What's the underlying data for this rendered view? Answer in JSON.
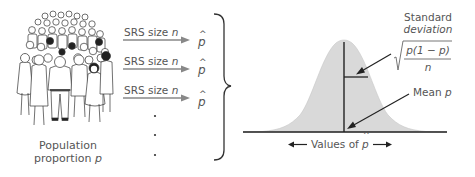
{
  "population": {
    "caption_line1": "Population",
    "caption_line2_prefix": "proportion ",
    "caption_line2_symbol": "p",
    "illustration": "crowd-of-people"
  },
  "samples": [
    {
      "label_prefix": "SRS size ",
      "label_symbol": "n",
      "result": "p",
      "result_accent": "^"
    },
    {
      "label_prefix": "SRS size ",
      "label_symbol": "n",
      "result": "p",
      "result_accent": "^"
    },
    {
      "label_prefix": "SRS size ",
      "label_symbol": "n",
      "result": "p",
      "result_accent": "^"
    }
  ],
  "continuation": ".",
  "distribution": {
    "shape": "normal-curve",
    "fill_color": "#d9d9d9",
    "line_color": "#222222",
    "sd_label_line1": "Standard",
    "sd_label_line2": "deviation",
    "sd_formula_numerator": "p(1 − p)",
    "sd_formula_denominator": "n",
    "mean_label_prefix": "Mean ",
    "mean_label_symbol": "p",
    "axis_label_prefix": "Values of ",
    "axis_label_symbol": "p",
    "axis_label_accent": "^",
    "axis_arrow_left": "←",
    "axis_arrow_right": "→"
  }
}
